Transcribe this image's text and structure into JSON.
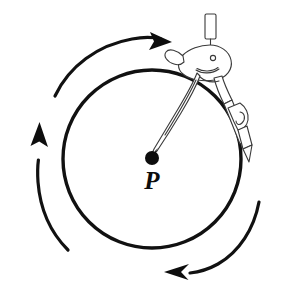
{
  "figure": {
    "kind": "geometry-diagram",
    "background_color": "#ffffff",
    "ink_color": "#111111",
    "instrument_outline_color": "#3a3a3a",
    "canvas": {
      "width": 281,
      "height": 288
    }
  },
  "circle": {
    "label": "drawn circle",
    "center_x": 152,
    "center_y": 159,
    "radius": 89,
    "stroke_width": 3.4,
    "stroke_color": "#111111"
  },
  "center_point": {
    "label": "P",
    "dot_x": 152,
    "dot_y": 158,
    "dot_radius": 7,
    "label_x": 152,
    "label_y": 189,
    "dot_color": "#0d0d0d"
  },
  "rotation_arrows": {
    "direction": "clockwise",
    "count": 3,
    "items": [
      {
        "name": "top-rotation-arrow",
        "position": "top-left to top",
        "points_toward": "right",
        "head_x": 167,
        "head_y": 41
      },
      {
        "name": "left-rotation-arrow",
        "position": "left",
        "points_toward": "up",
        "head_x": 39,
        "head_y": 150
      },
      {
        "name": "bottom-rotation-arrow",
        "position": "bottom-right to bottom",
        "points_toward": "left",
        "head_x": 171,
        "head_y": 272
      }
    ]
  },
  "compass": {
    "name": "drawing-compass",
    "hinge_x": 212,
    "hinge_y": 62,
    "knob_label": "top knob",
    "needle_leg_label": "needle leg resting on P",
    "pencil_leg_label": "pencil leg tracing the circle",
    "pencil_tip_x": 243,
    "pencil_tip_y": 160
  }
}
